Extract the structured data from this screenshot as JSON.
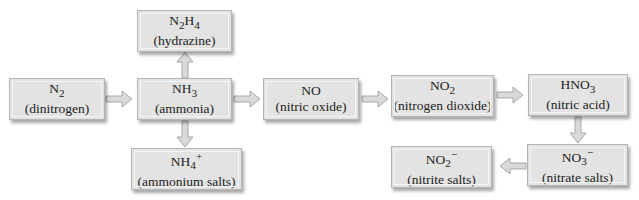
{
  "diagram": {
    "colors": {
      "box_fill": "#e3e3e3",
      "box_border": "#b5b5b5",
      "arrow_fill": "#d9d9d9",
      "arrow_stroke": "#a8a8a8"
    },
    "nodes": [
      {
        "id": "n2",
        "formula": "N2",
        "formula_html": "N<sub>2</sub>",
        "name": "(dinitrogen)"
      },
      {
        "id": "nh3",
        "formula": "NH3",
        "formula_html": "NH<sub>3</sub>",
        "name": "(ammonia)"
      },
      {
        "id": "n2h4",
        "formula": "N2H4",
        "formula_html": "N<sub>2</sub>H<sub>4</sub>",
        "name": "(hydrazine)"
      },
      {
        "id": "nh4",
        "formula": "NH4+",
        "formula_html": "NH<sub>4</sub><sup>+</sup>",
        "name": "(ammonium salts)"
      },
      {
        "id": "no",
        "formula": "NO",
        "formula_html": "NO",
        "name": "(nitric oxide)"
      },
      {
        "id": "no2",
        "formula": "NO2",
        "formula_html": "NO<sub>2</sub>",
        "name": "(nitrogen dioxide)"
      },
      {
        "id": "hno3",
        "formula": "HNO3",
        "formula_html": "HNO<sub>3</sub>",
        "name": "(nitric acid)"
      },
      {
        "id": "no3",
        "formula": "NO3-",
        "formula_html": "NO<sub>3</sub><sup>−</sup>",
        "name": "(nitrate salts)"
      },
      {
        "id": "no2m",
        "formula": "NO2-",
        "formula_html": "NO<sub>2</sub><sup>−</sup>",
        "name": "(nitrite salts)"
      }
    ],
    "edges": [
      {
        "from": "n2",
        "to": "nh3"
      },
      {
        "from": "nh3",
        "to": "n2h4"
      },
      {
        "from": "nh3",
        "to": "nh4"
      },
      {
        "from": "nh3",
        "to": "no"
      },
      {
        "from": "no",
        "to": "no2"
      },
      {
        "from": "no2",
        "to": "hno3"
      },
      {
        "from": "hno3",
        "to": "no3"
      },
      {
        "from": "no3",
        "to": "no2m"
      }
    ]
  }
}
